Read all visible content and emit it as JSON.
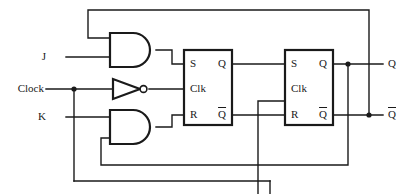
{
  "diagram": {
    "type": "logic-circuit-schematic",
    "stroke_color": "#1a1a1a",
    "background_color": "#ffffff",
    "width": 412,
    "height": 194
  },
  "inputs": [
    {
      "name": "j-input",
      "label": "J",
      "x": 46,
      "y": 57
    },
    {
      "name": "clock-input",
      "label": "Clock",
      "x": 14,
      "y": 89
    },
    {
      "name": "k-input",
      "label": "K",
      "x": 46,
      "y": 117
    }
  ],
  "outputs": [
    {
      "name": "q-output",
      "label": "Q",
      "overbar": false,
      "x": 388,
      "y": 64
    },
    {
      "name": "qbar-output",
      "label": "Q",
      "overbar": true,
      "x": 388,
      "y": 115
    }
  ],
  "gates": [
    {
      "name": "and-gate-upper",
      "type": "AND",
      "label": "",
      "x": 110,
      "y": 33,
      "w": 46,
      "h": 34
    },
    {
      "name": "inverter",
      "type": "NOT",
      "label": "",
      "x": 113,
      "y": 79,
      "w": 32,
      "h": 20
    },
    {
      "name": "and-gate-lower",
      "type": "AND",
      "label": "",
      "x": 110,
      "y": 110,
      "w": 46,
      "h": 34
    }
  ],
  "flipflops": [
    {
      "name": "flip-flop-master",
      "x": 184,
      "y": 50,
      "w": 48,
      "h": 75,
      "inputs": [
        {
          "label": "S",
          "y": 64
        },
        {
          "label": "Clk",
          "y": 89
        },
        {
          "label": "R",
          "y": 115
        }
      ],
      "outputs": [
        {
          "label": "Q",
          "overbar": false,
          "y": 64
        },
        {
          "label": "Q",
          "overbar": true,
          "y": 115
        }
      ]
    },
    {
      "name": "flip-flop-slave",
      "x": 285,
      "y": 50,
      "w": 48,
      "h": 75,
      "inputs": [
        {
          "label": "S",
          "y": 64
        },
        {
          "label": "Clk",
          "y": 89
        },
        {
          "label": "R",
          "y": 115
        }
      ],
      "outputs": [
        {
          "label": "Q",
          "overbar": false,
          "y": 64
        },
        {
          "label": "Q",
          "overbar": true,
          "y": 115
        }
      ]
    }
  ],
  "junctions": [
    {
      "name": "clock-branch-junction",
      "x": 74,
      "y": 89
    },
    {
      "name": "q-feedback-junction",
      "x": 348,
      "y": 64
    },
    {
      "name": "qbar-feedback-junction",
      "x": 369,
      "y": 115
    }
  ],
  "wires": [
    {
      "name": "wire-j-to-and-upper",
      "d": "M 66 57 L 110 57"
    },
    {
      "name": "wire-k-to-and-lower",
      "d": "M 66 117 L 110 117"
    },
    {
      "name": "wire-clock-to-inverter",
      "d": "M 46 89 L 113 89"
    },
    {
      "name": "wire-clock-branch-down",
      "d": "M 74 89 L 74 181"
    },
    {
      "name": "wire-clock-bottom-to-right",
      "d": "M 74 181 L 270 181"
    },
    {
      "name": "wire-inverter-to-ff1-clk",
      "d": "M 149 89 L 184 89"
    },
    {
      "name": "wire-and-upper-to-ff1-s",
      "d": "M 156 50 L 172 50 L 172 64 L 184 64"
    },
    {
      "name": "wire-and-lower-to-ff1-r",
      "d": "M 156 127 L 172 127 L 172 115 L 184 115"
    },
    {
      "name": "wire-ff1-q-to-ff2-s",
      "d": "M 232 64 L 285 64"
    },
    {
      "name": "wire-ff1-qbar-to-ff2-r",
      "d": "M 232 115 L 285 115"
    },
    {
      "name": "wire-ff2-clk-riser",
      "d": "M 258 194 L 258 101 L 285 101 L 285 89"
    },
    {
      "name": "wire-ff2-q-out",
      "d": "M 333 64 L 383 64"
    },
    {
      "name": "wire-ff2-qbar-out",
      "d": "M 333 115 L 383 115"
    },
    {
      "name": "wire-qbar-top-feedback",
      "d": "M 369 115 L 369 10 L 88 10 L 88 38 L 110 38"
    },
    {
      "name": "wire-q-bottom-feedback",
      "d": "M 348 64 L 348 165 L 101 165 L 101 138 L 110 138"
    }
  ]
}
